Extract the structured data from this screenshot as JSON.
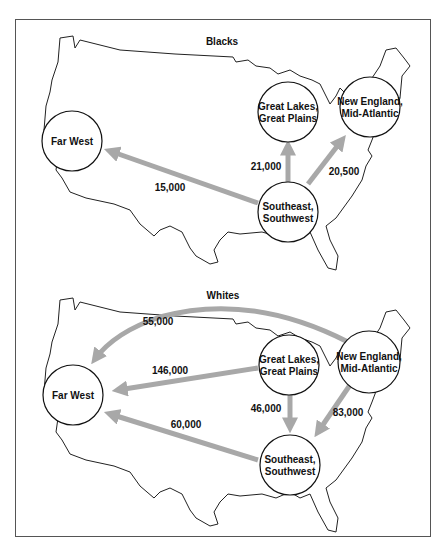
{
  "panels": [
    {
      "title": "Blacks",
      "regions": {
        "far_west": [
          "Far West"
        ],
        "great_lakes": [
          "Great Lakes,",
          "Great Plains"
        ],
        "new_england": [
          "New England,",
          "Mid-Atlantic"
        ],
        "southeast": [
          "Southeast,",
          "Southwest"
        ]
      },
      "flows": [
        {
          "from": "Southeast, Southwest",
          "to": "Far West",
          "value": "15,000"
        },
        {
          "from": "Southeast, Southwest",
          "to": "Great Lakes, Great Plains",
          "value": "21,000"
        },
        {
          "from": "Southeast, Southwest",
          "to": "New England, Mid-Atlantic",
          "value": "20,500"
        }
      ]
    },
    {
      "title": "Whites",
      "regions": {
        "far_west": [
          "Far West"
        ],
        "great_lakes": [
          "Great Lakes,",
          "Great Plains"
        ],
        "new_england": [
          "New England,",
          "Mid-Atlantic"
        ],
        "southeast": [
          "Southeast,",
          "Southwest"
        ]
      },
      "flows": [
        {
          "from": "New England, Mid-Atlantic",
          "to": "Far West",
          "value": "55,000"
        },
        {
          "from": "Great Lakes, Great Plains",
          "to": "Far West",
          "value": "146,000"
        },
        {
          "from": "Southeast, Southwest",
          "to": "Far West",
          "value": "60,000"
        },
        {
          "from": "Great Lakes, Great Plains",
          "to": "Southeast, Southwest",
          "value": "46,000"
        },
        {
          "from": "New England, Mid-Atlantic",
          "to": "Southeast, Southwest",
          "value": "83,000"
        }
      ]
    }
  ],
  "colors": {
    "arrow": "#a8a8a8",
    "outline": "#111111",
    "node_fill": "#ffffff"
  }
}
